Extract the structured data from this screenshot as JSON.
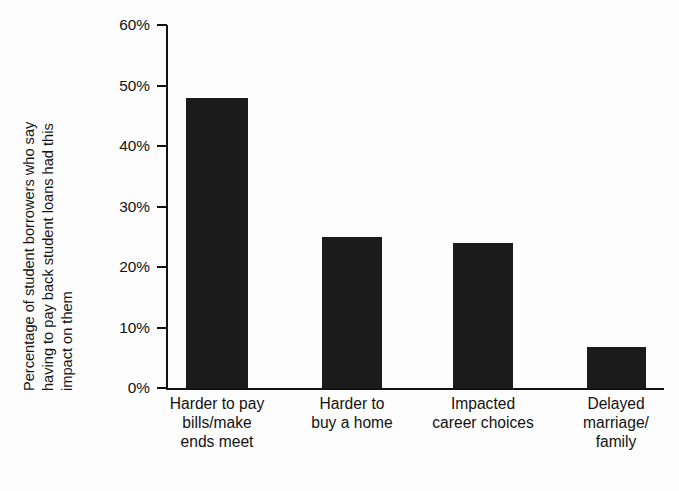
{
  "chart_data": {
    "type": "bar",
    "title": "",
    "xlabel": "",
    "ylabel": "Percentage of student borrowers who say having to pay back student loans had this impact on them",
    "ylabel_lines": [
      "Percentage of student borrowers who say",
      "having to pay back student loans had this",
      "impact on them"
    ],
    "categories": [
      "Harder to pay bills/make ends meet",
      "Harder to buy a home",
      "Impacted career choices",
      "Delayed marriage/family"
    ],
    "category_lines": [
      [
        "Harder to pay",
        "bills/make",
        "ends meet"
      ],
      [
        "Harder to",
        "buy a home"
      ],
      [
        "Impacted",
        "career choices"
      ],
      [
        "Delayed",
        "marriage/",
        "family"
      ]
    ],
    "values": [
      48,
      25,
      24,
      6.7
    ],
    "value_labels": [
      "48%",
      "25%",
      "24%",
      "7%"
    ],
    "ylim": [
      0,
      60
    ],
    "ytick_values": [
      0,
      10,
      20,
      30,
      40,
      50,
      60
    ],
    "ytick_labels": [
      "0%",
      "10%",
      "20%",
      "30%",
      "40%",
      "50%",
      "60%"
    ],
    "grid": false,
    "legend": false,
    "legend_position": "none",
    "bar_color": "#1b1b1b",
    "axis_color": "#111111",
    "background_color": "#fdfdfd"
  }
}
